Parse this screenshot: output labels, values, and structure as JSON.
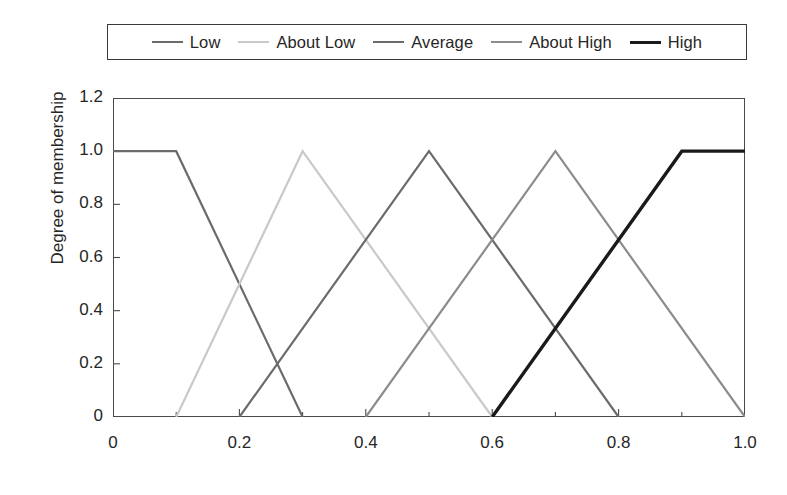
{
  "chart_data": {
    "type": "line",
    "title": "",
    "xlabel": "",
    "ylabel": "Degree of membership",
    "xlim": [
      0,
      1.0
    ],
    "ylim": [
      0,
      1.2
    ],
    "grid": false,
    "legend_position": "top",
    "xticks": [
      "0",
      "0.2",
      "0.4",
      "0.6",
      "0.8",
      "1.0"
    ],
    "xtick_values": [
      0,
      0.2,
      0.4,
      0.6,
      0.8,
      1.0
    ],
    "xminor_step": 0.1,
    "yticks": [
      "0",
      "0.2",
      "0.4",
      "0.6",
      "0.8",
      "1.0",
      "1.2"
    ],
    "ytick_values": [
      0,
      0.2,
      0.4,
      0.6,
      0.8,
      1.0,
      1.2
    ],
    "series": [
      {
        "name": "Low",
        "shape": "trapezoid",
        "color": "#6b6b6b",
        "width": 2.2,
        "x": [
          0.0,
          0.1,
          0.3
        ],
        "y": [
          1.0,
          1.0,
          0.0
        ]
      },
      {
        "name": "About Low",
        "shape": "triangle",
        "color": "#c9c9c9",
        "width": 2.2,
        "x": [
          0.1,
          0.3,
          0.6
        ],
        "y": [
          0.0,
          1.0,
          0.0
        ]
      },
      {
        "name": "Average",
        "shape": "triangle",
        "color": "#6b6b6b",
        "width": 2.2,
        "x": [
          0.2,
          0.5,
          0.8
        ],
        "y": [
          0.0,
          1.0,
          0.0
        ]
      },
      {
        "name": "About High",
        "shape": "triangle",
        "color": "#8c8c8c",
        "width": 2.2,
        "x": [
          0.4,
          0.7,
          1.0
        ],
        "y": [
          0.0,
          1.0,
          0.0
        ]
      },
      {
        "name": "High",
        "shape": "trapezoid",
        "color": "#1a1a1a",
        "width": 3.4,
        "x": [
          0.6,
          0.9,
          1.0
        ],
        "y": [
          0.0,
          1.0,
          1.0
        ]
      }
    ]
  },
  "legend": {
    "entries": [
      {
        "label": "Low",
        "color": "#6b6b6b",
        "width": 2.2
      },
      {
        "label": "About Low",
        "color": "#c9c9c9",
        "width": 2.2
      },
      {
        "label": "Average",
        "color": "#6b6b6b",
        "width": 2.2
      },
      {
        "label": "About High",
        "color": "#8c8c8c",
        "width": 2.2
      },
      {
        "label": "High",
        "color": "#1a1a1a",
        "width": 3.4
      }
    ]
  }
}
